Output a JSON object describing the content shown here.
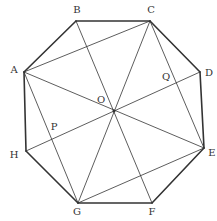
{
  "diagram": {
    "type": "regular-octagon-with-diagonals",
    "vertices": [
      {
        "name": "A",
        "x": 24,
        "y": 72,
        "lx": 14,
        "ly": 70
      },
      {
        "name": "B",
        "x": 76,
        "y": 21,
        "lx": 77,
        "ly": 10
      },
      {
        "name": "C",
        "x": 150,
        "y": 21,
        "lx": 151,
        "ly": 10
      },
      {
        "name": "D",
        "x": 200,
        "y": 72,
        "lx": 209,
        "ly": 73
      },
      {
        "name": "E",
        "x": 204,
        "y": 148,
        "lx": 212,
        "ly": 153
      },
      {
        "name": "F",
        "x": 152,
        "y": 203,
        "lx": 152,
        "ly": 212
      },
      {
        "name": "G",
        "x": 78,
        "y": 203,
        "lx": 77,
        "ly": 212
      },
      {
        "name": "H",
        "x": 26,
        "y": 151,
        "lx": 14,
        "ly": 155
      }
    ],
    "points": [
      {
        "name": "O",
        "x": 114,
        "y": 111,
        "lx": 101,
        "ly": 100
      },
      {
        "name": "P",
        "x": 55,
        "y": 138,
        "lx": 54,
        "ly": 127
      },
      {
        "name": "Q",
        "x": 175,
        "y": 86,
        "lx": 166,
        "ly": 77
      }
    ],
    "edges": [
      [
        "A",
        "B"
      ],
      [
        "B",
        "C"
      ],
      [
        "C",
        "D"
      ],
      [
        "D",
        "E"
      ],
      [
        "E",
        "F"
      ],
      [
        "F",
        "G"
      ],
      [
        "G",
        "H"
      ],
      [
        "H",
        "A"
      ]
    ],
    "segments": [
      [
        "A",
        "C"
      ],
      [
        "C",
        "E"
      ],
      [
        "E",
        "G"
      ],
      [
        "G",
        "A"
      ],
      [
        "A",
        "E"
      ],
      [
        "C",
        "G"
      ],
      [
        "B",
        "F"
      ],
      [
        "D",
        "H"
      ]
    ],
    "colors": {
      "stroke": "#333333",
      "label": "#333333"
    }
  }
}
